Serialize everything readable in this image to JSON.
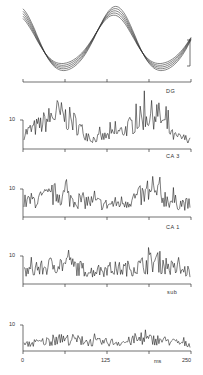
{
  "chart_data": [
    {
      "type": "line",
      "title": "",
      "description": "Superimposed field potential (theta) traces, 5 overlaid sweeps",
      "x_range_ms": [
        0,
        250
      ],
      "series_count": 5,
      "scale_bar": true,
      "approx_shape": "oscillation: high at 0ms, trough ~62ms, peak ~115ms, trough ~210ms, rising to 250ms"
    },
    {
      "type": "line",
      "panel_label": "DG",
      "ylabel_tick": "10",
      "x": [
        0,
        25,
        50,
        75,
        100,
        125,
        150,
        175,
        200,
        225,
        250
      ],
      "values": [
        5,
        8,
        12,
        9,
        3,
        4,
        6,
        10,
        12,
        4,
        3
      ],
      "ylim": [
        0,
        18
      ]
    },
    {
      "type": "line",
      "panel_label": "CA 3",
      "ylabel_tick": "10",
      "x": [
        0,
        25,
        50,
        75,
        100,
        125,
        150,
        175,
        200,
        225,
        250
      ],
      "values": [
        5,
        6,
        8,
        6,
        5,
        4,
        5,
        7,
        8,
        5,
        4
      ],
      "ylim": [
        0,
        18
      ]
    },
    {
      "type": "line",
      "panel_label": "CA 1",
      "ylabel_tick": "10",
      "x": [
        0,
        25,
        50,
        75,
        100,
        125,
        150,
        175,
        200,
        225,
        250
      ],
      "values": [
        4,
        5,
        7,
        6,
        4,
        5,
        5,
        6,
        8,
        5,
        4
      ],
      "ylim": [
        0,
        18
      ]
    },
    {
      "type": "line",
      "panel_label": "sub",
      "ylabel_tick": "10",
      "x": [
        0,
        25,
        50,
        75,
        100,
        125,
        150,
        175,
        200,
        225,
        250
      ],
      "values": [
        2,
        3,
        4,
        4,
        3,
        3,
        3,
        4,
        4,
        3,
        2
      ],
      "ylim": [
        0,
        18
      ],
      "xticks": [
        "0",
        "125",
        "250"
      ],
      "xlabel": "ms"
    }
  ],
  "labels": {
    "dg": "DG",
    "ca3": "CA 3",
    "ca1": "CA 1",
    "sub": "sub",
    "y10": "10",
    "x0": "0",
    "x125": "125",
    "x250": "250",
    "xunit": "ms"
  }
}
